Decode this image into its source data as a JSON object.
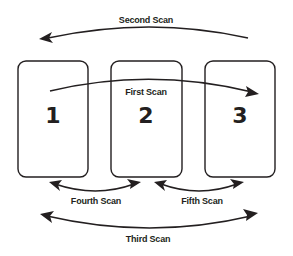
{
  "diagram": {
    "boxes": [
      {
        "label": "1"
      },
      {
        "label": "2"
      },
      {
        "label": "3"
      }
    ],
    "scans": [
      {
        "label": "First Scan",
        "direction": "left-to-right",
        "from": "1",
        "to": "3"
      },
      {
        "label": "Second Scan",
        "direction": "right-to-left",
        "from": "3",
        "to": "1"
      },
      {
        "label": "Third Scan",
        "direction": "bidirectional",
        "between": [
          "1",
          "3"
        ]
      },
      {
        "label": "Fourth Scan",
        "direction": "bidirectional",
        "between": [
          "1",
          "2"
        ]
      },
      {
        "label": "Fifth Scan",
        "direction": "bidirectional",
        "between": [
          "2",
          "3"
        ]
      }
    ],
    "colors": {
      "stroke": "#231f20",
      "background": "#ffffff"
    }
  }
}
